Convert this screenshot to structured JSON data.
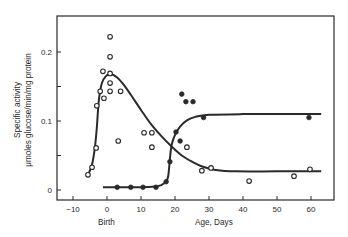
{
  "chart_data": {
    "type": "scatter",
    "title": "",
    "xlabel": "Age, Days",
    "x_annotation": "Birth",
    "ylabel_lines": [
      "Specific activity",
      "μmoles glucose/min/mg protein"
    ],
    "xlim": [
      -14,
      67
    ],
    "ylim": [
      -0.005,
      0.245
    ],
    "x_ticks": [
      -10,
      0,
      10,
      20,
      30,
      40,
      50,
      60
    ],
    "x_tick_labels": [
      "−10",
      "0",
      "10",
      "20",
      "30",
      "40",
      "50",
      "60"
    ],
    "y_ticks": [
      0,
      0.05,
      0.1,
      0.15,
      0.2
    ],
    "y_tick_labels": [
      "0",
      "",
      "0.1",
      "",
      "0.2"
    ],
    "grid": false,
    "legend": null,
    "series": [
      {
        "name": "open-circles",
        "marker": "open-circle",
        "points": [
          [
            -5.6,
            0.022
          ],
          [
            -4.4,
            0.033
          ],
          [
            -3.2,
            0.061
          ],
          [
            -3.0,
            0.122
          ],
          [
            -2.0,
            0.143
          ],
          [
            -1.2,
            0.172
          ],
          [
            -0.9,
            0.133
          ],
          [
            0.9,
            0.222
          ],
          [
            0.9,
            0.193
          ],
          [
            0.9,
            0.169
          ],
          [
            0.9,
            0.155
          ],
          [
            0.9,
            0.143
          ],
          [
            4.0,
            0.143
          ],
          [
            3.3,
            0.071
          ],
          [
            10.9,
            0.083
          ],
          [
            13.2,
            0.083
          ],
          [
            13.2,
            0.062
          ],
          [
            23.5,
            0.062
          ],
          [
            27.9,
            0.028
          ],
          [
            30.6,
            0.032
          ],
          [
            41.8,
            0.013
          ],
          [
            55.0,
            0.02
          ],
          [
            59.7,
            0.03
          ]
        ],
        "curve": [
          [
            -5.6,
            0.022
          ],
          [
            -4.5,
            0.035
          ],
          [
            -3.6,
            0.06
          ],
          [
            -3.0,
            0.09
          ],
          [
            -2.4,
            0.13
          ],
          [
            -1.5,
            0.155
          ],
          [
            -0.3,
            0.165
          ],
          [
            1.0,
            0.168
          ],
          [
            3.0,
            0.163
          ],
          [
            5.0,
            0.152
          ],
          [
            7.0,
            0.138
          ],
          [
            10.0,
            0.116
          ],
          [
            13.0,
            0.095
          ],
          [
            16.0,
            0.078
          ],
          [
            19.0,
            0.063
          ],
          [
            22.0,
            0.05
          ],
          [
            25.0,
            0.041
          ],
          [
            28.0,
            0.034
          ],
          [
            32.0,
            0.029
          ],
          [
            38.0,
            0.027
          ],
          [
            50.0,
            0.027
          ],
          [
            63.0,
            0.027
          ]
        ]
      },
      {
        "name": "filled-circles",
        "marker": "filled-circle",
        "points": [
          [
            3.0,
            0.004
          ],
          [
            7.0,
            0.004
          ],
          [
            10.6,
            0.004
          ],
          [
            14.4,
            0.004
          ],
          [
            17.4,
            0.012
          ],
          [
            18.5,
            0.041
          ],
          [
            20.3,
            0.084
          ],
          [
            21.5,
            0.071
          ],
          [
            22.0,
            0.139
          ],
          [
            23.2,
            0.128
          ],
          [
            25.3,
            0.128
          ],
          [
            28.4,
            0.105
          ],
          [
            59.4,
            0.105
          ]
        ],
        "curve": [
          [
            -1.2,
            0.004
          ],
          [
            5.0,
            0.004
          ],
          [
            10.0,
            0.004
          ],
          [
            14.0,
            0.005
          ],
          [
            16.0,
            0.007
          ],
          [
            17.3,
            0.012
          ],
          [
            18.0,
            0.02
          ],
          [
            18.5,
            0.045
          ],
          [
            19.0,
            0.065
          ],
          [
            20.0,
            0.08
          ],
          [
            21.5,
            0.092
          ],
          [
            23.5,
            0.101
          ],
          [
            26.0,
            0.106
          ],
          [
            30.0,
            0.109
          ],
          [
            40.0,
            0.11
          ],
          [
            50.0,
            0.11
          ],
          [
            63.0,
            0.11
          ]
        ]
      }
    ]
  },
  "labels": {
    "ylabel_line1": "Specific activity",
    "ylabel_line2": "μmoles glucose/min/mg protein",
    "xlabel": "Age, Days",
    "birth": "Birth"
  },
  "colors": {
    "ink": "#2a2a2a",
    "background": "#ffffff"
  }
}
